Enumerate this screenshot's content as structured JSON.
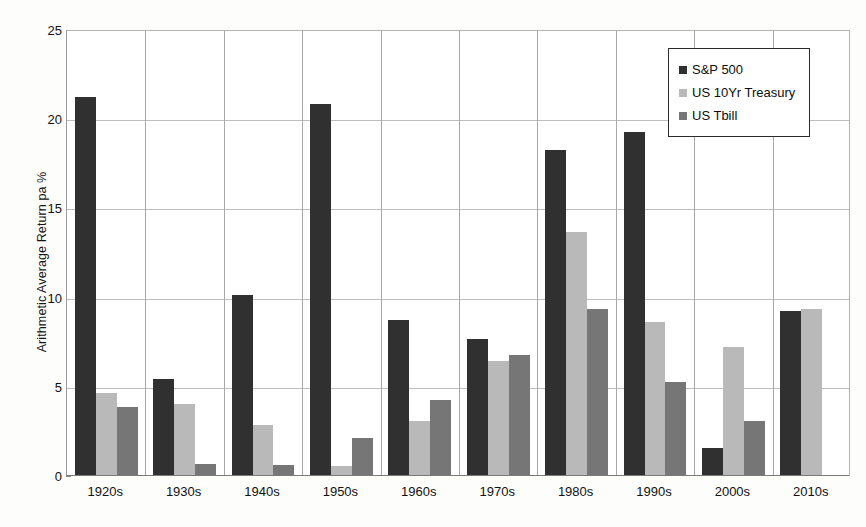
{
  "chart_data": {
    "type": "bar",
    "title": "",
    "xlabel": "",
    "ylabel": "Arithmetic Average Return pa %",
    "ylim": [
      0,
      25
    ],
    "yticks": [
      0,
      5,
      10,
      15,
      20,
      25
    ],
    "ytick_labels": [
      "0",
      "5",
      "10",
      "15",
      "20",
      "25"
    ],
    "grid": true,
    "legend_position": "top-right",
    "categories": [
      "1920s",
      "1930s",
      "1940s",
      "1950s",
      "1960s",
      "1970s",
      "1980s",
      "1990s",
      "2000s",
      "2010s"
    ],
    "series": [
      {
        "name": "S&P 500",
        "color": "#303030",
        "values": [
          21.2,
          5.4,
          10.1,
          20.8,
          8.7,
          7.6,
          18.2,
          19.2,
          1.5,
          9.2
        ]
      },
      {
        "name": "US 10Yr Treasury",
        "color": "#b9b9b9",
        "values": [
          4.6,
          4.0,
          2.8,
          0.5,
          3.0,
          6.4,
          13.6,
          8.6,
          7.2,
          9.3
        ]
      },
      {
        "name": "US Tbill",
        "color": "#767676",
        "values": [
          3.8,
          0.6,
          0.55,
          2.1,
          4.2,
          6.7,
          9.3,
          5.2,
          3.0,
          0.0
        ]
      }
    ]
  },
  "legend": {
    "entries": [
      {
        "label": "S&P 500"
      },
      {
        "label": "US 10Yr Treasury"
      },
      {
        "label": "US Tbill"
      }
    ]
  }
}
